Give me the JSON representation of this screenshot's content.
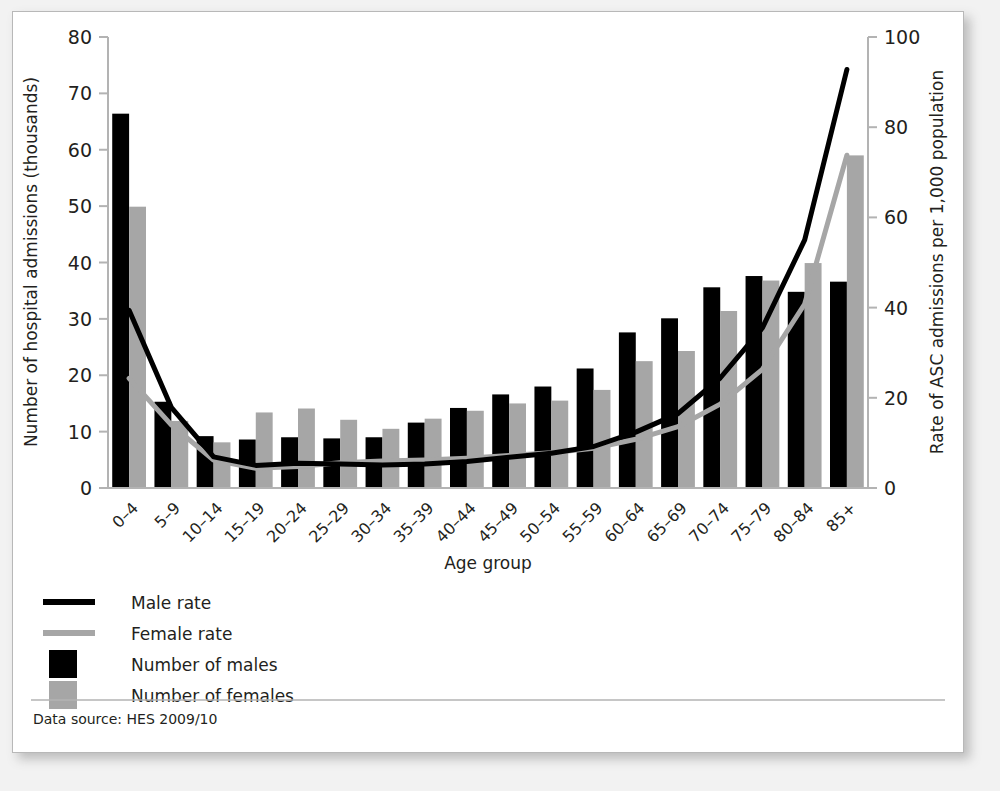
{
  "panel": {
    "source_note": "Data source: HES 2009/10"
  },
  "legend": {
    "items": [
      {
        "label": "Male rate",
        "marker": "line",
        "color": "#000000"
      },
      {
        "label": "Female rate",
        "marker": "line",
        "color": "#a6a6a6"
      },
      {
        "label": "Number of males",
        "marker": "swatch",
        "color": "#000000"
      },
      {
        "label": "Number of females",
        "marker": "swatch",
        "color": "#a6a6a6"
      }
    ]
  },
  "colors": {
    "male_bar": "#000000",
    "female_bar": "#a6a6a6",
    "male_line": "#000000",
    "female_line": "#a6a6a6",
    "axis": "#b3b3b3",
    "text": "#231f20",
    "panel_bg": "#ffffff",
    "page_bg": "#f2f2f2"
  },
  "chart_data": {
    "type": "bar",
    "title": "",
    "xlabel": "Age group",
    "ylabel": "Number of hospital admissions  (thousands)",
    "y2label": "Rate of ASC admissions per 1,000 population",
    "ylim": [
      0,
      80
    ],
    "y2lim": [
      0,
      100
    ],
    "yticks": [
      0,
      10,
      20,
      30,
      40,
      50,
      60,
      70,
      80
    ],
    "y2ticks": [
      0,
      20,
      40,
      60,
      80,
      100
    ],
    "grid": false,
    "legend_position": "below-left",
    "categories": [
      "0–4",
      "5–9",
      "10–14",
      "15–19",
      "20–24",
      "25–29",
      "30–34",
      "35–39",
      "40–44",
      "45–49",
      "50–54",
      "55–59",
      "60–64",
      "65–69",
      "70–74",
      "75–79",
      "80–84",
      "85+"
    ],
    "series": [
      {
        "name": "Number of males",
        "kind": "bar",
        "axis": "left",
        "unit": "thousands",
        "color": "#000000",
        "values": [
          66.4,
          15.3,
          9.2,
          8.6,
          9.0,
          8.8,
          9.0,
          11.6,
          14.2,
          16.6,
          18.0,
          21.2,
          27.6,
          30.1,
          35.6,
          37.6,
          34.8,
          36.6
        ]
      },
      {
        "name": "Number of females",
        "kind": "bar",
        "axis": "left",
        "unit": "thousands",
        "color": "#a6a6a6",
        "values": [
          49.9,
          11.9,
          8.1,
          13.4,
          14.1,
          12.1,
          10.5,
          12.3,
          13.7,
          15.0,
          15.5,
          17.4,
          22.5,
          24.3,
          31.4,
          36.8,
          39.9,
          59.0
        ]
      },
      {
        "name": "Male rate",
        "kind": "line",
        "axis": "right",
        "unit": "per 1,000 population",
        "color": "#000000",
        "values": [
          39.4,
          17.9,
          6.9,
          5.0,
          5.5,
          5.3,
          5.1,
          5.3,
          5.9,
          6.8,
          7.7,
          9.2,
          12.4,
          16.5,
          24.4,
          35.5,
          55.0,
          92.8
        ]
      },
      {
        "name": "Female rate",
        "kind": "line",
        "axis": "right",
        "unit": "per 1,000 population",
        "color": "#a6a6a6",
        "values": [
          24.3,
          14.0,
          6.2,
          4.4,
          4.8,
          5.6,
          6.0,
          6.2,
          6.6,
          7.2,
          7.8,
          8.8,
          10.8,
          13.6,
          18.6,
          26.3,
          40.8,
          73.8
        ]
      }
    ]
  }
}
